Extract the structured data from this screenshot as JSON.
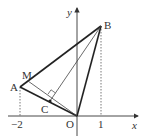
{
  "figure": {
    "type": "coordinate-geometry",
    "axes": {
      "x_label": "x",
      "y_label": "y",
      "origin_label": "O"
    },
    "ticks": {
      "x": [
        "−2",
        "1"
      ]
    },
    "points": [
      {
        "name": "A",
        "label": "A",
        "coords": [
          -2,
          null
        ]
      },
      {
        "name": "B",
        "label": "B",
        "coords": [
          1,
          null
        ]
      },
      {
        "name": "M",
        "label": "M"
      },
      {
        "name": "C",
        "label": "C"
      },
      {
        "name": "O",
        "label": "O",
        "coords": [
          0,
          0
        ]
      }
    ],
    "segments": [
      "AB",
      "BO",
      "OA",
      "OM",
      "BC"
    ],
    "annotations": [
      "right angle at BC ⊥ OM",
      "dashed verticals from A and B to x-axis"
    ],
    "colors": {
      "stroke": "#333333",
      "thin": "#555555"
    }
  }
}
